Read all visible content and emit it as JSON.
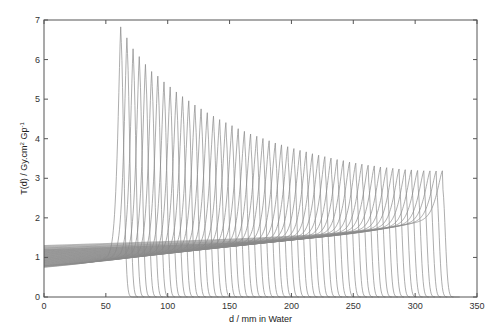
{
  "chart_data": {
    "type": "line",
    "title": "",
    "xlabel": "d / mm in Water",
    "ylabel_parts": {
      "main": "T(d) / Gy.cm",
      "sup1": "2",
      "mid": " Gp",
      "sup2": "-1"
    },
    "xlim": [
      0,
      350
    ],
    "ylim": [
      0,
      7
    ],
    "xticks": [
      0,
      50,
      100,
      150,
      200,
      250,
      300,
      350
    ],
    "yticks": [
      0,
      1,
      2,
      3,
      4,
      5,
      6,
      7
    ],
    "grid": false,
    "legend": "none",
    "line_color": "#8a8a8a",
    "axis_color": "#555555",
    "series_description": "53 depth-dose (Bragg) curves; each entry gives the Bragg peak depth (mm), peak value and entrance value at d=0",
    "series": [
      {
        "peak_depth": 62,
        "peak_value": 6.59,
        "entrance_value": 0.75
      },
      {
        "peak_depth": 67,
        "peak_value": 6.31,
        "entrance_value": 0.76
      },
      {
        "peak_depth": 72,
        "peak_value": 6.03,
        "entrance_value": 0.77
      },
      {
        "peak_depth": 77,
        "peak_value": 5.83,
        "entrance_value": 0.78
      },
      {
        "peak_depth": 82,
        "peak_value": 5.63,
        "entrance_value": 0.79
      },
      {
        "peak_depth": 87,
        "peak_value": 5.45,
        "entrance_value": 0.79
      },
      {
        "peak_depth": 92,
        "peak_value": 5.33,
        "entrance_value": 0.8
      },
      {
        "peak_depth": 97,
        "peak_value": 5.18,
        "entrance_value": 0.81
      },
      {
        "peak_depth": 102,
        "peak_value": 5.05,
        "entrance_value": 0.82
      },
      {
        "peak_depth": 107,
        "peak_value": 4.92,
        "entrance_value": 0.83
      },
      {
        "peak_depth": 112,
        "peak_value": 4.8,
        "entrance_value": 0.84
      },
      {
        "peak_depth": 117,
        "peak_value": 4.69,
        "entrance_value": 0.85
      },
      {
        "peak_depth": 122,
        "peak_value": 4.58,
        "entrance_value": 0.86
      },
      {
        "peak_depth": 127,
        "peak_value": 4.48,
        "entrance_value": 0.87
      },
      {
        "peak_depth": 132,
        "peak_value": 4.38,
        "entrance_value": 0.88
      },
      {
        "peak_depth": 137,
        "peak_value": 4.29,
        "entrance_value": 0.89
      },
      {
        "peak_depth": 142,
        "peak_value": 4.2,
        "entrance_value": 0.9
      },
      {
        "peak_depth": 147,
        "peak_value": 4.12,
        "entrance_value": 0.91
      },
      {
        "peak_depth": 152,
        "peak_value": 4.04,
        "entrance_value": 0.92
      },
      {
        "peak_depth": 157,
        "peak_value": 3.96,
        "entrance_value": 0.93
      },
      {
        "peak_depth": 162,
        "peak_value": 3.89,
        "entrance_value": 0.94
      },
      {
        "peak_depth": 167,
        "peak_value": 3.82,
        "entrance_value": 0.95
      },
      {
        "peak_depth": 172,
        "peak_value": 3.76,
        "entrance_value": 0.96
      },
      {
        "peak_depth": 177,
        "peak_value": 3.7,
        "entrance_value": 0.97
      },
      {
        "peak_depth": 182,
        "peak_value": 3.64,
        "entrance_value": 0.98
      },
      {
        "peak_depth": 187,
        "peak_value": 3.58,
        "entrance_value": 0.99
      },
      {
        "peak_depth": 192,
        "peak_value": 3.53,
        "entrance_value": 1.0
      },
      {
        "peak_depth": 197,
        "peak_value": 3.48,
        "entrance_value": 1.01
      },
      {
        "peak_depth": 202,
        "peak_value": 3.43,
        "entrance_value": 1.02
      },
      {
        "peak_depth": 207,
        "peak_value": 3.38,
        "entrance_value": 1.03
      },
      {
        "peak_depth": 212,
        "peak_value": 3.34,
        "entrance_value": 1.04
      },
      {
        "peak_depth": 217,
        "peak_value": 3.29,
        "entrance_value": 1.05
      },
      {
        "peak_depth": 222,
        "peak_value": 3.25,
        "entrance_value": 1.06
      },
      {
        "peak_depth": 227,
        "peak_value": 3.21,
        "entrance_value": 1.07
      },
      {
        "peak_depth": 232,
        "peak_value": 3.17,
        "entrance_value": 1.08
      },
      {
        "peak_depth": 237,
        "peak_value": 3.13,
        "entrance_value": 1.09
      },
      {
        "peak_depth": 242,
        "peak_value": 3.1,
        "entrance_value": 1.1
      },
      {
        "peak_depth": 247,
        "peak_value": 3.06,
        "entrance_value": 1.11
      },
      {
        "peak_depth": 252,
        "peak_value": 3.03,
        "entrance_value": 1.12
      },
      {
        "peak_depth": 257,
        "peak_value": 3.0,
        "entrance_value": 1.13
      },
      {
        "peak_depth": 262,
        "peak_value": 2.97,
        "entrance_value": 1.14
      },
      {
        "peak_depth": 267,
        "peak_value": 2.95,
        "entrance_value": 1.15
      },
      {
        "peak_depth": 272,
        "peak_value": 2.92,
        "entrance_value": 1.16
      },
      {
        "peak_depth": 277,
        "peak_value": 2.9,
        "entrance_value": 1.17
      },
      {
        "peak_depth": 282,
        "peak_value": 2.88,
        "entrance_value": 1.18
      },
      {
        "peak_depth": 287,
        "peak_value": 2.86,
        "entrance_value": 1.19
      },
      {
        "peak_depth": 292,
        "peak_value": 2.84,
        "entrance_value": 1.2
      },
      {
        "peak_depth": 297,
        "peak_value": 2.83,
        "entrance_value": 1.21
      },
      {
        "peak_depth": 302,
        "peak_value": 2.81,
        "entrance_value": 1.23
      },
      {
        "peak_depth": 307,
        "peak_value": 2.8,
        "entrance_value": 1.24
      },
      {
        "peak_depth": 312,
        "peak_value": 2.79,
        "entrance_value": 1.26
      },
      {
        "peak_depth": 317,
        "peak_value": 2.78,
        "entrance_value": 1.28
      },
      {
        "peak_depth": 322,
        "peak_value": 2.78,
        "entrance_value": 1.3
      }
    ]
  }
}
